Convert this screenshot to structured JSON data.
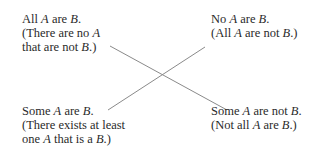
{
  "diagram": {
    "type": "square-of-opposition",
    "nodes": {
      "top_left": {
        "lines": [
          [
            {
              "t": "All "
            },
            {
              "t": "A",
              "i": true
            },
            {
              "t": " are "
            },
            {
              "t": "B",
              "i": true
            },
            {
              "t": "."
            }
          ],
          [
            {
              "t": "(There are no "
            },
            {
              "t": "A",
              "i": true
            }
          ],
          [
            {
              "t": "that are not "
            },
            {
              "t": "B",
              "i": true
            },
            {
              "t": ".)"
            }
          ]
        ],
        "text": "All A are B. (There are no A that are not B.)"
      },
      "top_right": {
        "lines": [
          [
            {
              "t": "No "
            },
            {
              "t": "A",
              "i": true
            },
            {
              "t": " are "
            },
            {
              "t": "B",
              "i": true
            },
            {
              "t": "."
            }
          ],
          [
            {
              "t": "(All "
            },
            {
              "t": "A",
              "i": true
            },
            {
              "t": " are not "
            },
            {
              "t": "B",
              "i": true
            },
            {
              "t": ".)"
            }
          ]
        ],
        "text": "No A are B. (All A are not B.)"
      },
      "bottom_left": {
        "lines": [
          [
            {
              "t": "Some "
            },
            {
              "t": "A",
              "i": true
            },
            {
              "t": " are "
            },
            {
              "t": "B",
              "i": true
            },
            {
              "t": "."
            }
          ],
          [
            {
              "t": "(There exists at least"
            }
          ],
          [
            {
              "t": "one "
            },
            {
              "t": "A",
              "i": true
            },
            {
              "t": " that is a "
            },
            {
              "t": "B",
              "i": true
            },
            {
              "t": ".)"
            }
          ]
        ],
        "text": "Some A are B. (There exists at least one A that is a B.)"
      },
      "bottom_right": {
        "lines": [
          [
            {
              "t": "Some "
            },
            {
              "t": "A",
              "i": true
            },
            {
              "t": " are not "
            },
            {
              "t": "B",
              "i": true
            },
            {
              "t": "."
            }
          ],
          [
            {
              "t": "(Not all "
            },
            {
              "t": "A",
              "i": true
            },
            {
              "t": " are "
            },
            {
              "t": "B",
              "i": true
            },
            {
              "t": ".)"
            }
          ]
        ],
        "text": "Some A are not B. (Not all A are B.)"
      }
    },
    "edges": [
      {
        "from": "top_left",
        "to": "bottom_right",
        "x1": 110,
        "y1": 46,
        "x2": 227,
        "y2": 110
      },
      {
        "from": "bottom_left",
        "to": "top_right",
        "x1": 108,
        "y1": 110,
        "x2": 205,
        "y2": 47
      }
    ],
    "line_color": "#8a8a8a"
  }
}
